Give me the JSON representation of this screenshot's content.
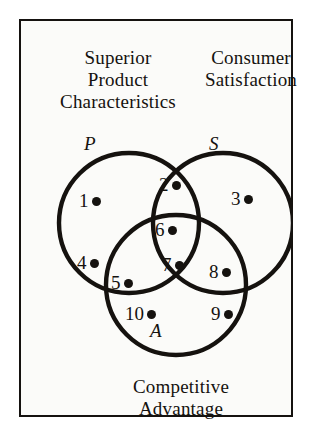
{
  "diagram": {
    "title_labels": {
      "top_left": "Superior\nProduct\nCharacteristics",
      "top_right": "Consumer\nSatisfaction",
      "bottom": "Competitive\nAdvantage"
    },
    "set_letters": {
      "p": "P",
      "s": "S",
      "a": "A"
    },
    "colors": {
      "background": "#fbfbf9",
      "page_background": "#ffffff",
      "ink": "#15120f",
      "border": "#15120f"
    },
    "circles": [
      {
        "name": "superior-product-characteristics",
        "letter": "P",
        "cx": 110,
        "cy": 204,
        "r": 70
      },
      {
        "name": "consumer-satisfaction",
        "letter": "S",
        "cx": 204,
        "cy": 204,
        "r": 70
      },
      {
        "name": "competitive-advantage",
        "letter": "A",
        "cx": 157,
        "cy": 266,
        "r": 70
      }
    ],
    "points": [
      {
        "id": 1,
        "label": "1",
        "x": 60,
        "y": 171,
        "region": "P only"
      },
      {
        "id": 2,
        "label": "2",
        "x": 140,
        "y": 155,
        "region": "P and S"
      },
      {
        "id": 3,
        "label": "3",
        "x": 212,
        "y": 169,
        "region": "S only"
      },
      {
        "id": 4,
        "label": "4",
        "x": 58,
        "y": 233,
        "region": "P only"
      },
      {
        "id": 5,
        "label": "5",
        "x": 92,
        "y": 253,
        "region": "P and A"
      },
      {
        "id": 6,
        "label": "6",
        "x": 136,
        "y": 200,
        "region": "P, S and A"
      },
      {
        "id": 7,
        "label": "7",
        "x": 143,
        "y": 235,
        "region": "P, S and A"
      },
      {
        "id": 8,
        "label": "8",
        "x": 190,
        "y": 242,
        "region": "S and A"
      },
      {
        "id": 9,
        "label": "9",
        "x": 192,
        "y": 284,
        "region": "A only"
      },
      {
        "id": 10,
        "label": "10",
        "x": 106,
        "y": 284,
        "region": "A only"
      }
    ]
  }
}
